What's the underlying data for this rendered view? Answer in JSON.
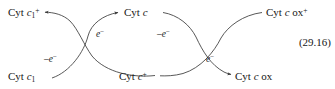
{
  "figure": {
    "kind": "reaction-scheme",
    "equation_number": "(29.16)",
    "ink_color": "#171717",
    "curve_color": "#3a3a3a",
    "background_color": "#ffffff"
  },
  "species": {
    "top_left": {
      "prefix": "Cyt ",
      "italic": "c",
      "sub": "1",
      "sup": "+",
      "plain": ""
    },
    "bottom_left": {
      "prefix": "Cyt ",
      "italic": "c",
      "sub": "1",
      "sup": "",
      "plain": ""
    },
    "top_center": {
      "prefix": "Cyt ",
      "italic": "c",
      "sub": "",
      "sup": "",
      "plain": ""
    },
    "bottom_center": {
      "prefix": "Cyt ",
      "italic": "c",
      "sub": "",
      "sup": "+",
      "plain": ""
    },
    "top_right": {
      "prefix": "Cyt ",
      "italic": "c",
      "sub": "",
      "sup": "+",
      "plain": " ox"
    },
    "bottom_right": {
      "prefix": "Cyt ",
      "italic": "c",
      "sub": "",
      "sup": "",
      "plain": " ox"
    }
  },
  "electron_labels": {
    "left_upper": {
      "text": "e",
      "sup": "−"
    },
    "left_lower": {
      "text": "–e",
      "sup": "−"
    },
    "right_upper": {
      "text": "–e",
      "sup": "−"
    },
    "right_lower": {
      "text": "e",
      "sup": "−"
    }
  }
}
